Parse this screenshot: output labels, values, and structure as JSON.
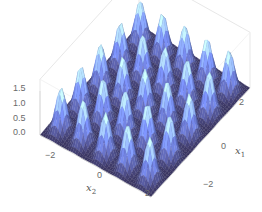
{
  "chart_data": {
    "type": "surface3d",
    "title": "",
    "xlabel": "x2",
    "ylabel": "x1",
    "zlabel": "",
    "x_range": [
      -3,
      3
    ],
    "y_range": [
      -3,
      3
    ],
    "z_range": [
      0,
      1.5
    ],
    "x_ticks": [
      "-2",
      "0",
      "2"
    ],
    "y_ticks": [
      "-2",
      "0",
      "2"
    ],
    "z_ticks": [
      "0.0",
      "0.5",
      "1.0",
      "1.5"
    ],
    "peaks_grid": {
      "rows": 5,
      "cols": 5,
      "spacing": 1.2,
      "peak_height": 1.45,
      "description": "5x5 lattice of narrow Gaussian-like peaks over the domain"
    },
    "colors": {
      "low": "#3a3560",
      "mid": "#6a7fd8",
      "high": "#bfeeff",
      "mesh": "#1c1c2a",
      "box": "#dddddd"
    }
  },
  "axes": {
    "x2": {
      "label_main": "x",
      "label_sub": "2",
      "ticks": [
        {
          "text": "−2"
        },
        {
          "text": "0"
        },
        {
          "text": "2"
        }
      ]
    },
    "x1": {
      "label_main": "x",
      "label_sub": "1",
      "ticks": [
        {
          "text": "−2"
        },
        {
          "text": "0"
        },
        {
          "text": "2"
        }
      ]
    },
    "z": {
      "ticks": [
        {
          "text": "1.5"
        },
        {
          "text": "1.0"
        },
        {
          "text": "0.5"
        },
        {
          "text": "0.0"
        }
      ]
    }
  }
}
